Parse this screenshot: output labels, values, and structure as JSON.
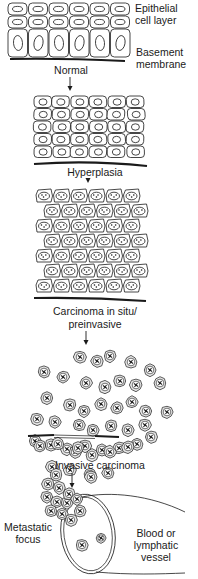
{
  "diagram": {
    "colors": {
      "line": "#1a1a1a",
      "cell_fill": "#ffffff",
      "tumor_cell_fill": "#e6e6e6",
      "background": "#ffffff"
    },
    "stages": [
      {
        "id": "normal",
        "label": "Normal"
      },
      {
        "id": "hyperplasia",
        "label": "Hyperplasia"
      },
      {
        "id": "carcinoma-in-situ",
        "label_line1": "Carcinoma in situ/",
        "label_line2": "preinvasive"
      },
      {
        "id": "invasive",
        "label": "Invasive carcinoma"
      },
      {
        "id": "metastasis",
        "label": ""
      }
    ],
    "annotations": {
      "epithelial_line1": "Epithelial",
      "epithelial_line2": "cell layer",
      "basement_line1": "Basement",
      "basement_line2": "membrane",
      "metastatic_line1": "Metastatic",
      "metastatic_line2": "focus",
      "vessel_line1": "Blood or",
      "vessel_line2": "lymphatic",
      "vessel_line3": "vessel"
    },
    "arrows": 4
  }
}
